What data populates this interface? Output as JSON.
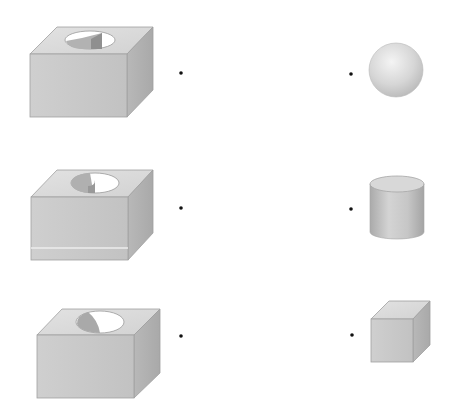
{
  "worksheet": {
    "header_text_partial": "",
    "task": "match each box with cutout to the solid that fits",
    "left_items": [
      {
        "name": "box-with-quarter-cylinder-hole",
        "hole_shape": "quarter-prism"
      },
      {
        "name": "box-with-half-cylinder-hole",
        "hole_shape": "half-cylinder",
        "has_band": true
      },
      {
        "name": "box-with-crescent-hole",
        "hole_shape": "hemisphere-cap"
      }
    ],
    "right_items": [
      {
        "name": "sphere"
      },
      {
        "name": "cylinder"
      },
      {
        "name": "cube"
      }
    ],
    "colors": {
      "front_face": "#c9c9c9",
      "top_face": "#dadada",
      "side_face": "#b4b4b4",
      "hole_light": "#ffffff",
      "hole_dark": "#a8a8a8",
      "dot": "#111111",
      "edge": "#9a9a9a"
    }
  }
}
